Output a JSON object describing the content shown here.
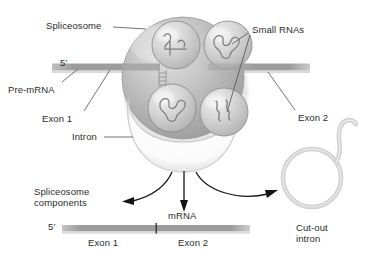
{
  "figure": {
    "background_color": "#ffffff",
    "width": 366,
    "height": 262
  },
  "labels": {
    "spliceosome": "Spliceosome",
    "small_rnas": "Small RNAs",
    "five_prime_top": "5′",
    "pre_mrna": "Pre-mRNA",
    "exon1_top": "Exon 1",
    "exon2_top": "Exon 2",
    "intron": "Intron",
    "spliceosome_components_line1": "Spliceosome",
    "spliceosome_components_line2": "components",
    "mrna": "mRNA",
    "five_prime_bottom": "5′",
    "exon1_bottom": "Exon 1",
    "exon2_bottom": "Exon 2",
    "cutout_line1": "Cut-out",
    "cutout_line2": "intron"
  },
  "colors": {
    "text": "#2b2b2b",
    "rna_strand": "#9a9a9a",
    "rna_strand_dark": "#8a8a8a",
    "spliceosome_fill": "#b9b9b9",
    "spliceosome_edge": "#8f8f8f",
    "snrnp_fill": "#cfcfcf",
    "snrnp_edge": "#8d8d8d",
    "intron_loop": "#d8d8d8",
    "lariat": "#d2d2d2",
    "arrow": "#1a1a1a",
    "leader_line": "#5a5a5a"
  },
  "structures": {
    "snrnp_count": 4,
    "snrnp_description": "small nuclear ribonucleoprotein spheres containing squiggly small RNA strands",
    "arrows": [
      {
        "name": "to-spliceosome-components",
        "direction": "down-left"
      },
      {
        "name": "to-mrna",
        "direction": "down"
      },
      {
        "name": "to-cutout-intron",
        "direction": "down-right"
      }
    ],
    "lariat_description": "circular cut-out intron with wavy tail"
  }
}
